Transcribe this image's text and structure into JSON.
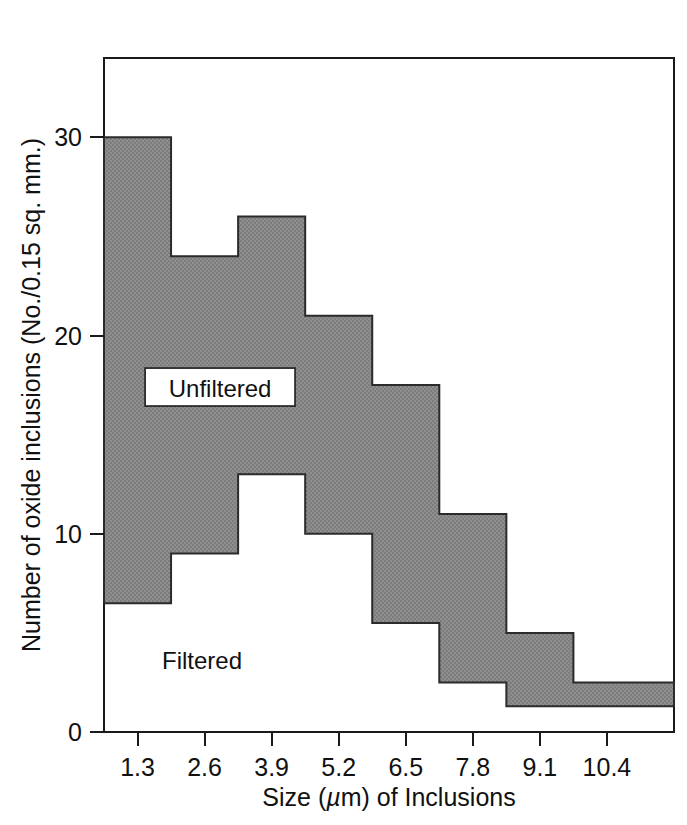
{
  "chart_data": {
    "type": "area",
    "title": "",
    "xlabel": "Size (µm) of Inclusions",
    "ylabel": "Number of oxide inclusions (No./0.15 sq. mm.)",
    "xlabel_parts": {
      "before": "Size (",
      "mu": "µ",
      "after": "m) of Inclusions"
    },
    "x_ticks": [
      "1.3",
      "2.6",
      "3.9",
      "5.2",
      "6.5",
      "7.8",
      "9.1",
      "10.4"
    ],
    "x_tick_values": [
      1.3,
      2.6,
      3.9,
      5.2,
      6.5,
      7.8,
      9.1,
      10.4
    ],
    "y_ticks": [
      "0",
      "10",
      "20",
      "30"
    ],
    "y_tick_values": [
      0,
      10,
      20,
      30
    ],
    "xlim": [
      0.65,
      11.7
    ],
    "ylim": [
      0,
      34
    ],
    "grid": false,
    "legend_position": "inside-annotations",
    "bin_edges": [
      0.65,
      1.95,
      3.25,
      4.55,
      5.85,
      7.15,
      8.45,
      9.75,
      11.7
    ],
    "bin_centers": [
      1.3,
      2.6,
      3.9,
      5.2,
      6.5,
      7.8,
      9.1,
      10.4
    ],
    "series": [
      {
        "name": "Unfiltered",
        "label": "Unfiltered",
        "description": "Upper step boundary of shaded band (cumulative unfiltered count)",
        "values": [
          30,
          24,
          26,
          21,
          17.5,
          11,
          5,
          2.5
        ]
      },
      {
        "name": "Filtered",
        "label": "Filtered",
        "description": "Lower step boundary of shaded band (filtered count)",
        "values": [
          6.5,
          9,
          13,
          10,
          5.5,
          2.5,
          1.3,
          1.3
        ]
      }
    ],
    "annotations": [
      {
        "text": "Unfiltered",
        "x": 2.9,
        "y": 17.3,
        "boxed": true
      },
      {
        "text": "Filtered",
        "x": 2.55,
        "y": 3.6,
        "boxed": false
      }
    ],
    "colors": {
      "band_fill": "#8c8c8c",
      "band_stroke": "#2b2b2b",
      "axis": "#1a1a1a",
      "text": "#111111",
      "background": "#ffffff"
    }
  },
  "figure": {
    "caption": ""
  }
}
